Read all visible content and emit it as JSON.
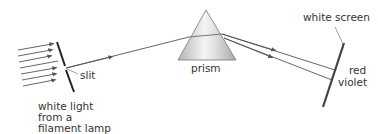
{
  "diagram": {
    "type": "optics-dispersion",
    "labels": {
      "slit": "slit",
      "source_line1": "white light",
      "source_line2": "from a",
      "source_line3": "filament lamp",
      "prism": "prism",
      "screen": "white screen",
      "red": "red",
      "violet": "violet"
    },
    "colors": {
      "line": "#555555",
      "screen": "#444444",
      "prism_light": "#f2f2f2",
      "prism_dark": "#b8b8b8",
      "text": "#333333"
    }
  }
}
